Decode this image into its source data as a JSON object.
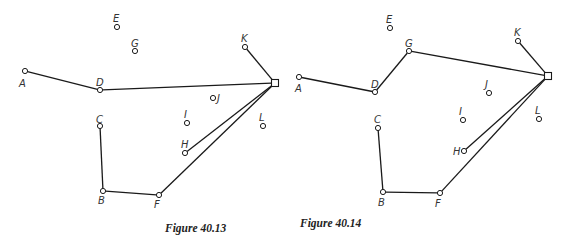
{
  "figures": [
    {
      "caption": "Figure 40.13",
      "caption_pos": [
        165,
        232
      ],
      "depot": {
        "x": 275,
        "y": 83,
        "size": 7
      },
      "nodes": [
        {
          "id": "A",
          "x": 25,
          "y": 71,
          "lx": 19,
          "ly": 87
        },
        {
          "id": "D",
          "x": 100,
          "y": 90,
          "lx": 96,
          "ly": 86
        },
        {
          "id": "E",
          "x": 117,
          "y": 27,
          "lx": 113,
          "ly": 22
        },
        {
          "id": "G",
          "x": 135,
          "y": 51,
          "lx": 131,
          "ly": 47
        },
        {
          "id": "K",
          "x": 245,
          "y": 47,
          "lx": 241,
          "ly": 42
        },
        {
          "id": "J",
          "x": 213,
          "y": 98,
          "lx": 217,
          "ly": 102
        },
        {
          "id": "I",
          "x": 187,
          "y": 123,
          "lx": 184,
          "ly": 118
        },
        {
          "id": "L",
          "x": 263,
          "y": 126,
          "lx": 259,
          "ly": 121
        },
        {
          "id": "C",
          "x": 100,
          "y": 126,
          "lx": 96,
          "ly": 123
        },
        {
          "id": "H",
          "x": 185,
          "y": 153,
          "lx": 181,
          "ly": 148
        },
        {
          "id": "B",
          "x": 103,
          "y": 191,
          "lx": 98,
          "ly": 204
        },
        {
          "id": "F",
          "x": 159,
          "y": 195,
          "lx": 154,
          "ly": 208
        }
      ],
      "edges": [
        [
          "A",
          "D"
        ],
        [
          "D",
          "depot"
        ],
        [
          "K",
          "depot"
        ],
        [
          "H",
          "depot"
        ],
        [
          "F",
          "depot"
        ],
        [
          "B",
          "F"
        ],
        [
          "C",
          "B"
        ]
      ]
    },
    {
      "caption": "Figure 40.14",
      "caption_pos": [
        300,
        227
      ],
      "depot": {
        "x": 548,
        "y": 76,
        "size": 7
      },
      "nodes": [
        {
          "id": "A",
          "x": 299,
          "y": 77,
          "lx": 295,
          "ly": 92
        },
        {
          "id": "D",
          "x": 375,
          "y": 92,
          "lx": 371,
          "ly": 88
        },
        {
          "id": "E",
          "x": 390,
          "y": 28,
          "lx": 386,
          "ly": 23
        },
        {
          "id": "G",
          "x": 409,
          "y": 51,
          "lx": 405,
          "ly": 47
        },
        {
          "id": "K",
          "x": 518,
          "y": 41,
          "lx": 514,
          "ly": 36
        },
        {
          "id": "J",
          "x": 489,
          "y": 93,
          "lx": 485,
          "ly": 88
        },
        {
          "id": "I",
          "x": 463,
          "y": 120,
          "lx": 459,
          "ly": 115
        },
        {
          "id": "L",
          "x": 539,
          "y": 119,
          "lx": 535,
          "ly": 114
        },
        {
          "id": "C",
          "x": 378,
          "y": 128,
          "lx": 374,
          "ly": 123
        },
        {
          "id": "H",
          "x": 464,
          "y": 151,
          "lx": 453,
          "ly": 155
        },
        {
          "id": "B",
          "x": 383,
          "y": 192,
          "lx": 378,
          "ly": 206
        },
        {
          "id": "F",
          "x": 440,
          "y": 193,
          "lx": 435,
          "ly": 207
        }
      ],
      "edges": [
        [
          "A",
          "D"
        ],
        [
          "D",
          "G"
        ],
        [
          "G",
          "depot"
        ],
        [
          "K",
          "depot"
        ],
        [
          "H",
          "depot"
        ],
        [
          "F",
          "depot"
        ],
        [
          "B",
          "F"
        ],
        [
          "C",
          "B"
        ]
      ]
    }
  ]
}
